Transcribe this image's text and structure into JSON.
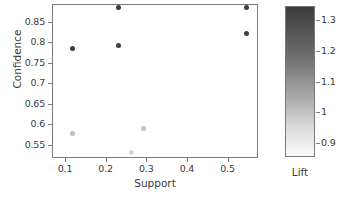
{
  "chart_data": {
    "type": "scatter",
    "title": "",
    "xlabel": "Support",
    "ylabel": "Confidence",
    "xlim": [
      0.068,
      0.575
    ],
    "ylim": [
      0.518,
      0.893
    ],
    "grid": false,
    "xticks": [
      0.1,
      0.2,
      0.3,
      0.4,
      0.5
    ],
    "xtick_labels": [
      "0.1",
      "0.2",
      "0.3",
      "0.4",
      "0.5"
    ],
    "yticks": [
      0.85,
      0.8,
      0.75,
      0.7,
      0.65,
      0.6,
      0.55
    ],
    "ytick_labels": [
      "0.85",
      "0.8",
      "0.75",
      "0.7",
      "0.65",
      "0.6",
      "0.55"
    ],
    "colorbar": {
      "label": "Lift",
      "position": "right",
      "vmin": 0.855,
      "vmax": 1.345,
      "ticks": [
        1.3,
        1.2,
        1.1,
        1,
        0.9
      ],
      "tick_labels": [
        "1.3",
        "1.2",
        "1.1",
        "1",
        "0.9"
      ],
      "colormap": "grays-reversed",
      "color_high": "#3b3b3b",
      "color_low": "#fbfbfb"
    },
    "points": [
      {
        "x": 0.115,
        "y": 0.787,
        "lift": 1.31,
        "color": "#3c3c3c"
      },
      {
        "x": 0.23,
        "y": 0.888,
        "lift": 1.33,
        "color": "#3a3a3a"
      },
      {
        "x": 0.228,
        "y": 0.794,
        "lift": 1.3,
        "color": "#3f3f3f"
      },
      {
        "x": 0.545,
        "y": 0.888,
        "lift": 1.32,
        "color": "#3b3b3b"
      },
      {
        "x": 0.545,
        "y": 0.823,
        "lift": 1.29,
        "color": "#404040"
      },
      {
        "x": 0.115,
        "y": 0.58,
        "lift": 0.95,
        "color": "#bdbdbd"
      },
      {
        "x": 0.29,
        "y": 0.593,
        "lift": 0.94,
        "color": "#c2c2c2"
      },
      {
        "x": 0.26,
        "y": 0.533,
        "lift": 0.89,
        "color": "#d6d6d6"
      }
    ]
  }
}
